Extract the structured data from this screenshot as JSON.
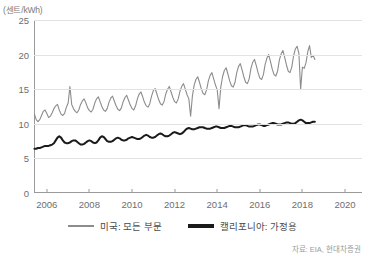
{
  "chart_data": {
    "type": "line",
    "title": "",
    "subtitle": "",
    "xlabel": "",
    "ylabel": "",
    "unit_label": "(센트/kWh)",
    "grid": true,
    "legend_position": "bottom",
    "ylim": [
      0,
      25
    ],
    "yticks": [
      0,
      5,
      10,
      15,
      20,
      25
    ],
    "xlim": [
      2005.4,
      2020.8
    ],
    "xticks": [
      2006,
      2008,
      2010,
      2012,
      2014,
      2016,
      2018,
      2020
    ],
    "xtick_labels": [
      "2006",
      "2008",
      "2010",
      "2012",
      "2014",
      "2016",
      "2018",
      "2020"
    ],
    "source": "자료: EIA, 현대차증권",
    "series": [
      {
        "name": "미국: 모든 부문",
        "color": "#8c8c8c",
        "width": 1.1,
        "x_start": 2005.42,
        "x_step": 0.08333,
        "values": [
          11.4,
          10.6,
          10.3,
          10.6,
          11.2,
          11.8,
          12.0,
          11.5,
          10.9,
          11.1,
          11.6,
          12.2,
          12.6,
          12.8,
          12.0,
          11.4,
          11.2,
          11.5,
          12.4,
          13.0,
          15.4,
          12.8,
          12.2,
          11.8,
          11.6,
          12.0,
          12.8,
          13.3,
          13.6,
          13.0,
          12.3,
          11.9,
          11.7,
          12.1,
          13.0,
          13.6,
          13.9,
          13.2,
          12.5,
          12.0,
          11.8,
          12.2,
          13.1,
          13.7,
          14.0,
          13.3,
          12.6,
          12.1,
          11.9,
          12.3,
          13.2,
          13.8,
          14.1,
          13.4,
          12.7,
          12.2,
          12.0,
          12.6,
          13.6,
          14.3,
          14.6,
          13.9,
          13.1,
          12.6,
          12.4,
          12.9,
          14.0,
          14.8,
          15.1,
          14.3,
          13.5,
          12.9,
          12.7,
          13.2,
          14.3,
          15.0,
          15.4,
          14.6,
          13.8,
          13.2,
          13.0,
          13.6,
          14.7,
          15.4,
          15.8,
          15.0,
          14.2,
          13.6,
          11.1,
          14.0,
          15.6,
          16.4,
          16.8,
          16.0,
          15.1,
          14.4,
          14.2,
          14.9,
          16.2,
          17.0,
          17.4,
          16.5,
          15.6,
          14.9,
          12.2,
          15.3,
          16.8,
          17.7,
          18.1,
          17.2,
          16.2,
          15.5,
          15.3,
          16.0,
          17.4,
          18.3,
          18.7,
          17.8,
          16.8,
          16.0,
          15.8,
          16.5,
          18.0,
          18.9,
          19.3,
          18.4,
          17.4,
          16.6,
          16.4,
          17.1,
          18.6,
          19.5,
          20.0,
          19.0,
          17.9,
          17.1,
          16.9,
          17.6,
          19.2,
          20.1,
          20.6,
          19.6,
          18.5,
          17.6,
          17.4,
          18.2,
          19.8,
          20.8,
          21.2,
          20.2,
          15.0,
          18.2,
          18.0,
          18.8,
          20.4,
          21.3,
          19.6,
          19.9,
          19.3
        ]
      },
      {
        "name": "캘리포니아: 가정용",
        "color": "#1a1a1a",
        "width": 2.0,
        "x_start": 2005.42,
        "x_step": 0.08333,
        "values": [
          6.4,
          6.4,
          6.5,
          6.5,
          6.6,
          6.7,
          6.8,
          6.8,
          6.8,
          6.9,
          7.0,
          7.2,
          7.6,
          8.0,
          8.2,
          8.0,
          7.6,
          7.3,
          7.2,
          7.2,
          7.3,
          7.5,
          7.6,
          7.6,
          7.4,
          7.2,
          7.0,
          7.0,
          7.1,
          7.3,
          7.5,
          7.6,
          7.5,
          7.3,
          7.2,
          7.3,
          7.6,
          8.0,
          8.2,
          8.1,
          7.8,
          7.5,
          7.4,
          7.4,
          7.5,
          7.7,
          7.9,
          8.0,
          7.9,
          7.7,
          7.6,
          7.6,
          7.7,
          7.9,
          8.0,
          8.1,
          8.0,
          7.9,
          7.8,
          7.8,
          7.9,
          8.1,
          8.3,
          8.4,
          8.3,
          8.1,
          8.0,
          8.0,
          8.1,
          8.3,
          8.5,
          8.6,
          8.5,
          8.3,
          8.2,
          8.2,
          8.3,
          8.5,
          8.7,
          8.8,
          8.7,
          8.6,
          8.5,
          8.6,
          8.8,
          9.1,
          9.3,
          9.4,
          9.3,
          9.2,
          9.2,
          9.3,
          9.4,
          9.5,
          9.5,
          9.5,
          9.4,
          9.3,
          9.3,
          9.3,
          9.4,
          9.5,
          9.6,
          9.6,
          9.5,
          9.4,
          9.4,
          9.4,
          9.5,
          9.6,
          9.7,
          9.7,
          9.6,
          9.5,
          9.5,
          9.5,
          9.6,
          9.7,
          9.8,
          9.8,
          9.7,
          9.6,
          9.6,
          9.6,
          9.7,
          9.8,
          9.9,
          9.9,
          9.8,
          9.7,
          9.7,
          9.8,
          9.9,
          10.0,
          10.1,
          10.1,
          10.0,
          9.9,
          9.9,
          9.9,
          10.0,
          10.1,
          10.2,
          10.2,
          10.1,
          10.0,
          10.0,
          10.1,
          10.3,
          10.5,
          10.6,
          10.5,
          10.3,
          10.1,
          10.1,
          10.1,
          10.2,
          10.3,
          10.3
        ]
      }
    ]
  },
  "legend": {
    "items": [
      {
        "label": "미국: 모든 부문",
        "color": "#8c8c8c"
      },
      {
        "label": "캘리포니아: 가정용",
        "color": "#1a1a1a"
      }
    ]
  }
}
